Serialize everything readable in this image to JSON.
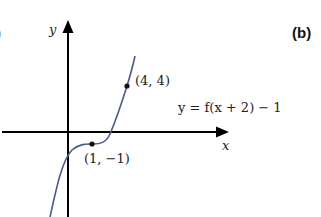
{
  "figure": {
    "panel_label": "(b)",
    "prev_panel_fragment": ")",
    "axes": {
      "x_label": "x",
      "y_label": "y"
    },
    "curve": {
      "equation": "y = f(x + 2) − 1",
      "color": "#4a5a8a"
    },
    "points": [
      {
        "label": "(4, 4)",
        "x": 4,
        "y": 4
      },
      {
        "label": "(1, −1)",
        "x": 1,
        "y": -1
      }
    ]
  }
}
